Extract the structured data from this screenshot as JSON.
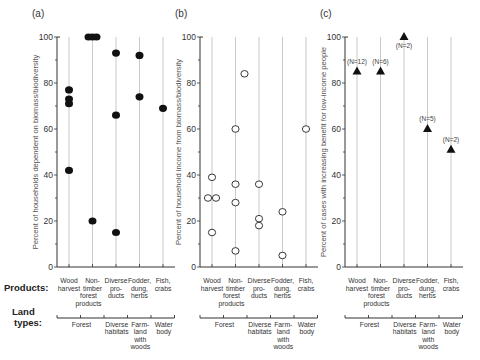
{
  "row_labels": {
    "products": "Products:",
    "land_types_line1": "Land",
    "land_types_line2": "types:"
  },
  "products": [
    [
      "Wood",
      "harvest"
    ],
    [
      "Non-",
      "timber",
      "forest",
      "products"
    ],
    [
      "Diverse",
      "pro-",
      "ducts"
    ],
    [
      "Fodder,",
      "dung,",
      "herbs"
    ],
    [
      "Fish,",
      "crabs"
    ]
  ],
  "land_types": [
    {
      "lines": [
        "Forest"
      ],
      "span": [
        0,
        2
      ]
    },
    {
      "lines": [
        "Diverse",
        "habitats"
      ],
      "span": [
        2,
        3
      ]
    },
    {
      "lines": [
        "Farm-",
        "land",
        "with",
        "woods"
      ],
      "span": [
        3,
        4
      ]
    },
    {
      "lines": [
        "Water",
        "body"
      ],
      "span": [
        4,
        5
      ]
    }
  ],
  "colors": {
    "axis": "#333333",
    "grid": "#bbbbbb",
    "marker": "#111111",
    "text": "#333333"
  },
  "chart_data": [
    {
      "panel_label": "(a)",
      "type": "scatter",
      "marker": "filled-circle",
      "ylabel": "Percent of households dependent on biomass/biodiversity",
      "ylim": [
        0,
        100
      ],
      "yticks": [
        0,
        20,
        40,
        60,
        80,
        100
      ],
      "categories": [
        "Wood harvest",
        "Non-timber forest products",
        "Diverse products",
        "Fodder, dung, herbs",
        "Fish, crabs"
      ],
      "points": [
        {
          "cat": 0,
          "dx": 0,
          "y": 77
        },
        {
          "cat": 0,
          "dx": 0,
          "y": 73
        },
        {
          "cat": 0,
          "dx": 0,
          "y": 71
        },
        {
          "cat": 0,
          "dx": 0,
          "y": 42
        },
        {
          "cat": 1,
          "dx": -4,
          "y": 100
        },
        {
          "cat": 1,
          "dx": 0,
          "y": 100
        },
        {
          "cat": 1,
          "dx": 4,
          "y": 100
        },
        {
          "cat": 1,
          "dx": 0,
          "y": 20
        },
        {
          "cat": 2,
          "dx": 0,
          "y": 93
        },
        {
          "cat": 2,
          "dx": 0,
          "y": 66
        },
        {
          "cat": 2,
          "dx": 0,
          "y": 15
        },
        {
          "cat": 3,
          "dx": 0,
          "y": 92
        },
        {
          "cat": 3,
          "dx": 0,
          "y": 74
        },
        {
          "cat": 4,
          "dx": 0,
          "y": 69
        }
      ]
    },
    {
      "panel_label": "(b)",
      "type": "scatter",
      "marker": "open-circle",
      "ylabel": "Percent of household income from biomass/biodiversity",
      "ylim": [
        0,
        100
      ],
      "yticks": [
        0,
        20,
        40,
        60,
        80,
        100
      ],
      "categories": [
        "Wood harvest",
        "Non-timber forest products",
        "Diverse products",
        "Fodder, dung, herbs",
        "Fish, crabs"
      ],
      "points": [
        {
          "cat": 0,
          "dx": 0,
          "y": 39
        },
        {
          "cat": 0,
          "dx": -4,
          "y": 30
        },
        {
          "cat": 0,
          "dx": 4,
          "y": 30
        },
        {
          "cat": 0,
          "dx": 0,
          "y": 15
        },
        {
          "cat": 1,
          "dx": 0,
          "y": 60
        },
        {
          "cat": 1,
          "dx": 0,
          "y": 36
        },
        {
          "cat": 1,
          "dx": 0,
          "y": 28
        },
        {
          "cat": 1,
          "dx": 0,
          "y": 7
        },
        {
          "cat": 1,
          "dx": 9,
          "y": 84
        },
        {
          "cat": 2,
          "dx": 0,
          "y": 36
        },
        {
          "cat": 2,
          "dx": 0,
          "y": 21
        },
        {
          "cat": 2,
          "dx": 0,
          "y": 18
        },
        {
          "cat": 3,
          "dx": 0,
          "y": 24
        },
        {
          "cat": 3,
          "dx": 0,
          "y": 5
        },
        {
          "cat": 4,
          "dx": 0,
          "y": 60
        }
      ]
    },
    {
      "panel_label": "(c)",
      "type": "scatter",
      "marker": "filled-triangle",
      "ylabel": "Percent of cases with increasing benefit for low-income people",
      "ylim": [
        0,
        100
      ],
      "yticks": [
        0,
        20,
        40,
        60,
        80,
        100
      ],
      "categories": [
        "Wood harvest",
        "Non-timber forest products",
        "Diverse products",
        "Fodder, dung, herbs",
        "Fish, crabs"
      ],
      "points": [
        {
          "cat": 0,
          "dx": 0,
          "y": 85,
          "label": "(N=12)",
          "label_pos": "above"
        },
        {
          "cat": 1,
          "dx": 0,
          "y": 85,
          "label": "(N=6)",
          "label_pos": "above"
        },
        {
          "cat": 2,
          "dx": 0,
          "y": 100,
          "label": "(N=2)",
          "label_pos": "below"
        },
        {
          "cat": 3,
          "dx": 0,
          "y": 60,
          "label": "(N=5)",
          "label_pos": "above"
        },
        {
          "cat": 4,
          "dx": 0,
          "y": 51,
          "label": "(N=2)",
          "label_pos": "above"
        }
      ]
    }
  ]
}
